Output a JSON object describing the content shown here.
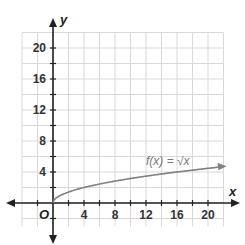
{
  "chart_data": {
    "type": "line",
    "title": "",
    "xlabel": "x",
    "ylabel": "y",
    "xlim": [
      -6,
      22
    ],
    "ylim": [
      -4,
      22
    ],
    "grid": true,
    "grid_step": 2,
    "x_ticks": [
      4,
      8,
      12,
      16,
      20
    ],
    "y_ticks": [
      4,
      8,
      12,
      16,
      20
    ],
    "origin_label": "O",
    "series": [
      {
        "name": "f(x) = √x",
        "x": [
          0,
          1,
          2,
          4,
          6,
          8,
          10,
          12,
          14,
          16,
          18,
          20,
          22
        ],
        "values": [
          0,
          1,
          1.41,
          2,
          2.45,
          2.83,
          3.16,
          3.46,
          3.74,
          4,
          4.24,
          4.47,
          4.69
        ],
        "color": "#808080",
        "arrow_end": true
      }
    ],
    "annotations": [
      {
        "text": "f(x) = √x",
        "x": 13,
        "y": 6
      }
    ]
  },
  "labels": {
    "x_axis": "x",
    "y_axis": "y",
    "origin": "O",
    "function": "f(x) = √x",
    "xt0": "4",
    "xt1": "8",
    "xt2": "12",
    "xt3": "16",
    "xt4": "20",
    "yt0": "4",
    "yt1": "8",
    "yt2": "12",
    "yt3": "16",
    "yt4": "20"
  }
}
